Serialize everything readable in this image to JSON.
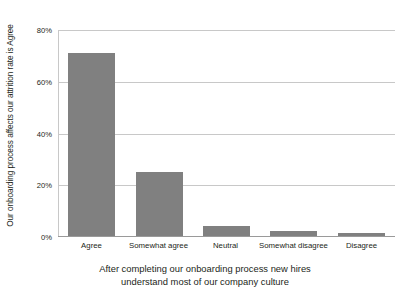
{
  "chart_data": {
    "type": "bar",
    "title": "",
    "categories": [
      "Agree",
      "Somewhat agree",
      "Neutral",
      "Somewhat disagree",
      "Disagree"
    ],
    "values": [
      71,
      25,
      4,
      2,
      1
    ],
    "series": [
      {
        "name": "Our onboarding process affects our attrition rate is Agree",
        "values": [
          71,
          25,
          4,
          2,
          1
        ]
      }
    ],
    "xlabel_lines": [
      "After completing our onboarding process new hires",
      "understand most of our company culture"
    ],
    "ylabel": "Our onboarding process affects our attrition rate is Agree",
    "ylim": [
      0,
      80
    ],
    "yticks": [
      0,
      20,
      40,
      60,
      80
    ],
    "ytick_labels": [
      "0%",
      "20%",
      "40%",
      "60%",
      "80%"
    ],
    "grid": true,
    "grid_axis": "y",
    "legend": false,
    "legend_position": "none",
    "bar_color": "#808080",
    "gridline_color": "#c8c8c8",
    "axis_color": "#9a9a9a",
    "text_color": "#231f20",
    "background_color": "#ffffff",
    "value_unit": "%"
  }
}
